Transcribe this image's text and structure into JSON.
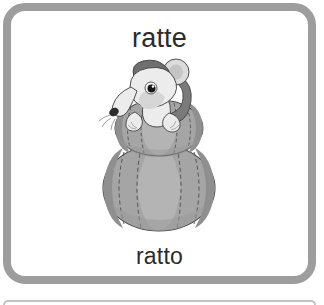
{
  "card": {
    "word_top": "ratte",
    "word_bottom": "ratto",
    "border_color": "#9d9d9d",
    "background_color": "#ffffff",
    "text_color": "#2b2b2b"
  },
  "illustration": {
    "name": "rat-on-pumpkins",
    "description": "Grayscale cartoon drawing of a rat sitting on top of two stacked pumpkins",
    "colors": {
      "pumpkin_body": "#a5a5a5",
      "pumpkin_shadow": "#8d8d8d",
      "pumpkin_highlight": "#b6b6b6",
      "pumpkin_outline": "#4a4a4a",
      "rat_body": "#ececec",
      "rat_shadow": "#c9c9c9",
      "rat_ear_dark": "#6f6f6f",
      "rat_tail": "#7a7a7a",
      "rat_eye": "#161616",
      "rat_outline": "#3d3d3d"
    },
    "parts": [
      "rat-head",
      "rat-ear-left",
      "rat-ear-right",
      "rat-eye",
      "rat-snout",
      "rat-tail",
      "rat-paw-left",
      "rat-paw-right",
      "pumpkin-top",
      "pumpkin-bottom",
      "pumpkin-stem"
    ]
  },
  "next_card": {
    "name": "next-flashcard-edge"
  }
}
